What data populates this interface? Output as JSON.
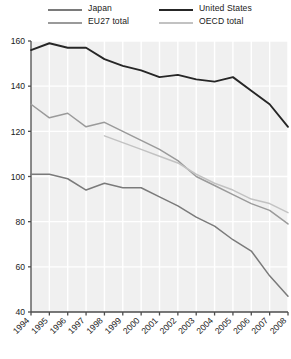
{
  "chart_data": {
    "type": "line",
    "title": "",
    "subtitle": "",
    "xlabel": "",
    "ylabel": "",
    "x": [
      "1994",
      "1995",
      "1996",
      "1997",
      "1998",
      "1999",
      "2000",
      "2001",
      "2002",
      "2003",
      "2004",
      "2005",
      "2006",
      "2007",
      "2008"
    ],
    "xlim": [
      "1994",
      "2008"
    ],
    "ylim": [
      40,
      160
    ],
    "yticks": [
      40,
      60,
      80,
      100,
      120,
      140,
      160
    ],
    "grid": true,
    "legend_position": "top",
    "series": [
      {
        "name": "Japan",
        "color": "#7a7a7a",
        "values": [
          101,
          101,
          99,
          94,
          97,
          95,
          95,
          91,
          87,
          82,
          78,
          72,
          67,
          56,
          47
        ]
      },
      {
        "name": "EU27 total",
        "color": "#9a9a9a",
        "values": [
          132,
          126,
          128,
          122,
          124,
          120,
          116,
          112,
          107,
          100,
          96,
          92,
          88,
          85,
          79
        ]
      },
      {
        "name": "United States",
        "color": "#262626",
        "values": [
          156,
          159,
          157,
          157,
          152,
          149,
          147,
          144,
          145,
          143,
          142,
          144,
          138,
          132,
          122
        ]
      },
      {
        "name": "OECD total",
        "color": "#c2c2c2",
        "values": [
          null,
          null,
          null,
          null,
          118,
          115,
          112,
          109,
          106,
          101,
          97,
          94,
          90,
          88,
          84
        ]
      }
    ]
  },
  "legend": {
    "entries": [
      {
        "label": "Japan",
        "color": "#7a7a7a"
      },
      {
        "label": "EU27 total",
        "color": "#9a9a9a"
      },
      {
        "label": "United States",
        "color": "#262626"
      },
      {
        "label": "OECD total",
        "color": "#c2c2c2"
      }
    ]
  },
  "axes": {
    "y_labels": [
      "160",
      "140",
      "120",
      "100",
      "80",
      "60",
      "40"
    ],
    "x_labels": [
      "1994",
      "1995",
      "1996",
      "1997",
      "1998",
      "1999",
      "2000",
      "2001",
      "2002",
      "2003",
      "2004",
      "2005",
      "2006",
      "2007",
      "2008"
    ]
  },
  "colors": {
    "plot_background": "#f0f0f0",
    "gridline": "#ffffff",
    "axis": "#4d4d4d",
    "text": "#1a1a1a"
  }
}
